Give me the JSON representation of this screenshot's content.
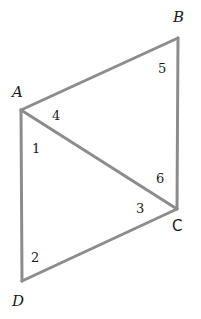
{
  "figure": {
    "stroke_color": "#8c8c8c",
    "vertices": {
      "A": {
        "label": "A",
        "x": 21,
        "y": 110
      },
      "B": {
        "label": "B",
        "x": 178,
        "y": 38
      },
      "C": {
        "label": "C",
        "x": 177,
        "y": 209
      },
      "D": {
        "label": "D",
        "x": 22,
        "y": 281
      }
    },
    "segments": [
      "AB",
      "BC",
      "CD",
      "DA",
      "AC"
    ],
    "angle_labels": {
      "a1": "1",
      "a2": "2",
      "a3": "3",
      "a4": "4",
      "a5": "5",
      "a6": "6"
    }
  }
}
